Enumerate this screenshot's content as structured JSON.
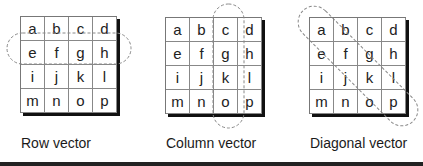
{
  "matrix": [
    [
      "a",
      "b",
      "c",
      "d"
    ],
    [
      "e",
      "f",
      "g",
      "h"
    ],
    [
      "i",
      "j",
      "k",
      "l"
    ],
    [
      "m",
      "n",
      "o",
      "p"
    ]
  ],
  "panels": [
    {
      "label": "Row vector",
      "highlight": "row 2 (e f g h)"
    },
    {
      "label": "Column vector",
      "highlight": "column 3 (c g k o)"
    },
    {
      "label": "Diagonal vector",
      "highlight": "main diagonal (a f k p)"
    }
  ],
  "colors": {
    "grid_line": "#888888",
    "shadow": "#111111",
    "dashed_outline": "#888888",
    "rule": "#222222"
  }
}
